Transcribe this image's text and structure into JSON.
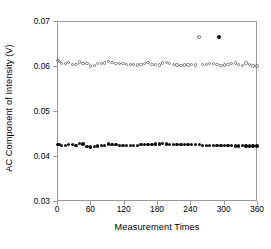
{
  "chart_data": {
    "type": "scatter",
    "title": "",
    "xlabel": "Measurement Times",
    "ylabel": "AC Component of Intensity (V)",
    "xlim": [
      0,
      360
    ],
    "ylim": [
      0.03,
      0.07
    ],
    "xticks": [
      "0",
      "60",
      "120",
      "180",
      "240",
      "300",
      "360"
    ],
    "xtick_values": [
      0,
      60,
      120,
      180,
      240,
      300,
      360
    ],
    "yticks": [
      "0.03",
      "0.04",
      "0.05",
      "0.06",
      "0.07"
    ],
    "ytick_values": [
      0.03,
      0.04,
      0.05,
      0.06,
      0.07
    ],
    "grid": false,
    "legend": null,
    "series": [
      {
        "name": "open-circle-series",
        "marker": "open-circle",
        "color": "#6f6f6f",
        "x": [
          2,
          4,
          8,
          15,
          21,
          28,
          34,
          41,
          47,
          54,
          60,
          67,
          73,
          80,
          86,
          93,
          99,
          106,
          112,
          119,
          125,
          132,
          138,
          145,
          151,
          158,
          164,
          171,
          177,
          184,
          190,
          197,
          203,
          210,
          216,
          223,
          229,
          236,
          242,
          249,
          256,
          262,
          269,
          275,
          282,
          288,
          295,
          301,
          308,
          314,
          321,
          327,
          334,
          340,
          347,
          353,
          360
        ],
        "y": [
          0.0612,
          0.061,
          0.0606,
          0.0606,
          0.0608,
          0.0604,
          0.0604,
          0.0609,
          0.0605,
          0.0605,
          0.06,
          0.0601,
          0.0606,
          0.0606,
          0.0607,
          0.061,
          0.0608,
          0.0605,
          0.0606,
          0.0605,
          0.0604,
          0.0604,
          0.0604,
          0.0602,
          0.0603,
          0.0605,
          0.0608,
          0.0604,
          0.0603,
          0.0602,
          0.0607,
          0.0608,
          0.0606,
          0.0604,
          0.0602,
          0.0601,
          0.0602,
          0.0602,
          0.0604,
          0.0602,
          0.0664,
          0.0603,
          0.0604,
          0.0605,
          0.0605,
          0.0603,
          0.0601,
          0.0602,
          0.0604,
          0.0605,
          0.0607,
          0.0603,
          0.0601,
          0.0607,
          0.0603,
          0.06,
          0.06
        ],
        "outlier_points": [
          {
            "x": 256,
            "y": 0.0664
          }
        ]
      },
      {
        "name": "filled-circle-series",
        "marker": "filled-circle",
        "color": "#111111",
        "x": [
          2,
          4,
          8,
          15,
          21,
          28,
          34,
          41,
          47,
          54,
          60,
          67,
          73,
          80,
          86,
          93,
          99,
          106,
          112,
          119,
          125,
          132,
          138,
          145,
          151,
          158,
          164,
          171,
          177,
          184,
          190,
          197,
          203,
          210,
          216,
          223,
          229,
          236,
          242,
          249,
          256,
          262,
          269,
          275,
          282,
          288,
          292,
          295,
          301,
          308,
          314,
          321,
          327,
          334,
          340,
          347,
          353,
          360
        ],
        "y": [
          0.0426,
          0.0425,
          0.0424,
          0.0424,
          0.0425,
          0.0426,
          0.0423,
          0.0428,
          0.0427,
          0.0421,
          0.042,
          0.0421,
          0.0422,
          0.0424,
          0.0424,
          0.0427,
          0.0426,
          0.0425,
          0.0424,
          0.0424,
          0.0424,
          0.0424,
          0.0424,
          0.0424,
          0.0425,
          0.0425,
          0.0426,
          0.0426,
          0.0427,
          0.0427,
          0.0428,
          0.0427,
          0.0426,
          0.0425,
          0.0425,
          0.0426,
          0.0426,
          0.0425,
          0.0425,
          0.0426,
          0.0425,
          0.0424,
          0.0424,
          0.0424,
          0.0423,
          0.0423,
          0.0664,
          0.0423,
          0.0423,
          0.0423,
          0.0423,
          0.0422,
          0.0422,
          0.0423,
          0.0422,
          0.0422,
          0.0422,
          0.0422
        ],
        "outlier_points": [
          {
            "x": 292,
            "y": 0.0664
          }
        ]
      }
    ]
  }
}
